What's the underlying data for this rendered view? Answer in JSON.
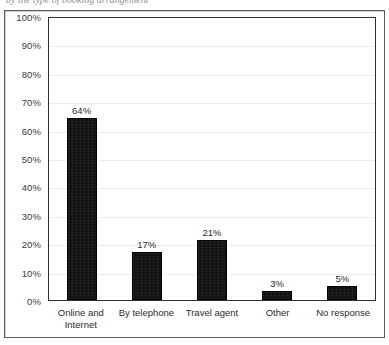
{
  "caption_cutoff": "by the type of booking arrangement",
  "chart_data": {
    "type": "bar",
    "title": "",
    "xlabel": "",
    "ylabel": "",
    "categories": [
      "Online and Internet",
      "By telephone",
      "Travel agent",
      "Other",
      "No response"
    ],
    "category_lines": [
      [
        "Online and",
        "Internet"
      ],
      [
        "By telephone"
      ],
      [
        "Travel agent"
      ],
      [
        "Other"
      ],
      [
        "No response"
      ]
    ],
    "values": [
      64,
      17,
      21,
      3,
      5
    ],
    "data_labels": [
      "64%",
      "17%",
      "21%",
      "3%",
      "5%"
    ],
    "ylim": [
      0,
      100
    ],
    "ytick_values": [
      100,
      90,
      80,
      70,
      60,
      50,
      40,
      30,
      20,
      10,
      0
    ],
    "ytick_labels": [
      "100%",
      "90%",
      "80%",
      "70%",
      "60%",
      "50%",
      "40%",
      "30%",
      "20%",
      "10%",
      "0%"
    ],
    "grid": true,
    "legend": false,
    "bar_color": "#111111",
    "grid_color": "#ededed",
    "axis_color": "#2f2f2f"
  }
}
